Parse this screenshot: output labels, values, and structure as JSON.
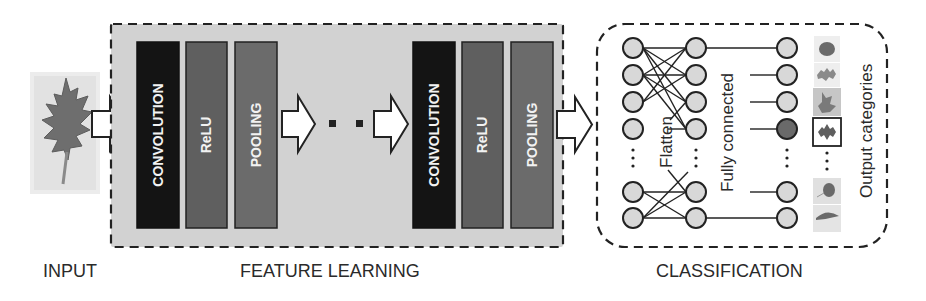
{
  "colors": {
    "feature_box_fill": "#d2d2d2",
    "convolution": "#141414",
    "relu": "#5f5f5f",
    "pooling": "#6b6b6b",
    "node_fill": "#d8d8d8",
    "node_active": "#6a6a6a",
    "stroke": "#222222"
  },
  "input": {
    "label": "INPUT",
    "image": "oak-leaf-image"
  },
  "feature_learning": {
    "label": "FEATURE LEARNING",
    "stages": [
      {
        "blocks": [
          {
            "label": "CONVOLUTION"
          },
          {
            "label": "ReLU"
          },
          {
            "label": "POOLING"
          }
        ]
      },
      {
        "blocks": [
          {
            "label": "CONVOLUTION"
          },
          {
            "label": "ReLU"
          },
          {
            "label": "POOLING"
          }
        ]
      }
    ],
    "ellipsis": ". ."
  },
  "classification": {
    "label": "CLASSIFICATION",
    "flatten_label": "Flatten",
    "fully_connected_label": "Fully connected",
    "output_label": "Output categories",
    "selected_output_index": 3,
    "output_thumbnails": [
      "round-leaf",
      "lobed-leaf",
      "maple-leaf",
      "oak-leaf-selected",
      "small-leaf",
      "long-leaf"
    ]
  }
}
